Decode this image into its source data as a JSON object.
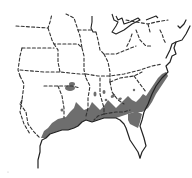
{
  "map": {
    "region": "Southeastern United States",
    "description": "Species distribution range map",
    "legend": [],
    "colors": {
      "background": "#ffffff",
      "range_fill": "#6e6e6e",
      "state_borders": "#333333",
      "coastline": "#222222"
    },
    "range_areas": [
      {
        "name": "gulf-coast-range",
        "type": "main"
      },
      {
        "name": "atlantic-coast-range",
        "type": "main"
      },
      {
        "name": "inland-patch",
        "type": "isolated"
      }
    ]
  }
}
